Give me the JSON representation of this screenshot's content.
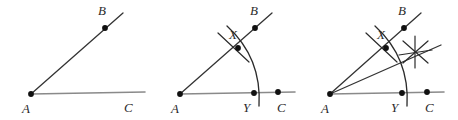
{
  "figure": {
    "colors": {
      "ray_dark": "#333333",
      "ray_gray": "#8a8a8a",
      "arc": "#2b2b2b",
      "point": "#111111",
      "label": "#2b2b2b",
      "background": "#ffffff"
    },
    "panels": [
      {
        "id": "panel-1",
        "step": "1",
        "caption": "Angle BAC",
        "labels": [
          {
            "name": "A",
            "text": "A",
            "x": 22,
            "y": 113
          },
          {
            "name": "B",
            "text": "B",
            "x": 98,
            "y": 15
          },
          {
            "name": "C",
            "text": "C",
            "x": 124,
            "y": 112
          }
        ],
        "points": [
          {
            "name": "A",
            "x": 31,
            "y": 94
          },
          {
            "name": "B",
            "x": 105,
            "y": 28
          }
        ],
        "rays": [
          {
            "name": "ray-AB",
            "x1": 31,
            "y1": 94,
            "x2": 123,
            "y2": 13,
            "shade": "dark"
          },
          {
            "name": "ray-AC",
            "x1": 31,
            "y1": 94,
            "x2": 145,
            "y2": 92,
            "shade": "gray"
          }
        ],
        "arcs": [],
        "ticks": []
      },
      {
        "id": "panel-2",
        "step": "2",
        "caption": "Arc centered at A crossing both rays at X and Y",
        "labels": [
          {
            "name": "A",
            "text": "A",
            "x": 171,
            "y": 113
          },
          {
            "name": "B",
            "text": "B",
            "x": 250,
            "y": 15
          },
          {
            "name": "C",
            "text": "C",
            "x": 277,
            "y": 112
          },
          {
            "name": "X",
            "text": "X",
            "x": 229,
            "y": 39
          },
          {
            "name": "Y",
            "text": "Y",
            "x": 243,
            "y": 112
          }
        ],
        "points": [
          {
            "name": "A",
            "x": 180,
            "y": 94
          },
          {
            "name": "B",
            "x": 255,
            "y": 28
          },
          {
            "name": "C",
            "x": 278,
            "y": 92
          },
          {
            "name": "X",
            "x": 238,
            "y": 48
          },
          {
            "name": "Y",
            "x": 254,
            "y": 93
          }
        ],
        "rays": [
          {
            "name": "ray-AB",
            "x1": 180,
            "y1": 94,
            "x2": 272,
            "y2": 13,
            "shade": "dark"
          },
          {
            "name": "ray-AC",
            "x1": 180,
            "y1": 94,
            "x2": 295,
            "y2": 92,
            "shade": "gray"
          }
        ],
        "arcs": [
          {
            "name": "arc-XY",
            "d": "M 227 26 Q 262 58 259 106"
          }
        ],
        "ticks": [
          {
            "name": "tick-at-X",
            "x1": 218,
            "y1": 33,
            "x2": 249,
            "y2": 62
          }
        ]
      },
      {
        "id": "panel-3",
        "step": "3",
        "caption": "Arcs from X and Y intersect; bisector drawn from A",
        "labels": [
          {
            "name": "A",
            "text": "A",
            "x": 321,
            "y": 113
          },
          {
            "name": "B",
            "text": "B",
            "x": 398,
            "y": 15
          },
          {
            "name": "C",
            "text": "C",
            "x": 425,
            "y": 112
          },
          {
            "name": "X",
            "text": "X",
            "x": 377,
            "y": 39
          },
          {
            "name": "Y",
            "text": "Y",
            "x": 391,
            "y": 112
          }
        ],
        "points": [
          {
            "name": "A",
            "x": 330,
            "y": 94
          },
          {
            "name": "B",
            "x": 404,
            "y": 28
          },
          {
            "name": "C",
            "x": 427,
            "y": 92
          },
          {
            "name": "X",
            "x": 386,
            "y": 48
          },
          {
            "name": "Y",
            "x": 402,
            "y": 93
          }
        ],
        "rays": [
          {
            "name": "ray-AB",
            "x1": 330,
            "y1": 94,
            "x2": 421,
            "y2": 13,
            "shade": "dark"
          },
          {
            "name": "ray-AC",
            "x1": 330,
            "y1": 94,
            "x2": 444,
            "y2": 92,
            "shade": "gray"
          },
          {
            "name": "ray-bisector",
            "x1": 330,
            "y1": 94,
            "x2": 441,
            "y2": 45,
            "shade": "dark"
          }
        ],
        "arcs": [
          {
            "name": "arc-XY",
            "d": "M 375 26 Q 410 58 407 106"
          }
        ],
        "ticks": [
          {
            "name": "tick-at-X",
            "x1": 366,
            "y1": 33,
            "x2": 397,
            "y2": 62
          },
          {
            "name": "star-stroke-1",
            "x1": 403,
            "y1": 41,
            "x2": 428,
            "y2": 63
          },
          {
            "name": "star-stroke-2",
            "x1": 428,
            "y1": 41,
            "x2": 403,
            "y2": 63
          },
          {
            "name": "star-stroke-3",
            "x1": 415,
            "y1": 36,
            "x2": 415,
            "y2": 68
          },
          {
            "name": "star-stroke-4",
            "x1": 399,
            "y1": 55,
            "x2": 432,
            "y2": 50
          }
        ],
        "intersection": {
          "name": "star-center",
          "x": 415,
          "y": 52
        }
      }
    ]
  }
}
